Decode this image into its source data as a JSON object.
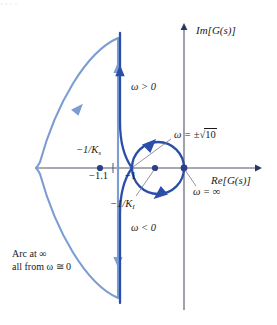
{
  "figure": {
    "kind": "nyquist-plot",
    "axes": {
      "imaginary_label": "Im[G(s)]",
      "real_label": "Re[G(s)]"
    },
    "colors": {
      "curve_dark": "#2b4fa8",
      "curve_light": "#7b9dd4",
      "axis": "#555566",
      "text": "#1a1a1a"
    },
    "labels": {
      "omega_positive": "ω > 0",
      "omega_negative": "ω < 0",
      "omega_sqrt10_pre": "ω = ±",
      "omega_sqrt10_radical": "√",
      "omega_sqrt10_value": "10",
      "omega_infinity": "ω = ∞",
      "minus_one_over_Ks_main": "−1/K",
      "minus_one_over_Ks_sub": "s",
      "minus_one_over_KI_main": "−1/K",
      "minus_one_over_KI_sub": "I",
      "point_minus_1_1": "−1.1",
      "point_minus_1": "−1",
      "caption_line1": "Arc at ∞",
      "caption_line2": "all from ω ≅ 0"
    },
    "marked_points": [
      {
        "name": "minus-1-1-point",
        "label": "−1.1",
        "x": -1.1
      },
      {
        "name": "minus-1-over-KI-point",
        "label": "−1/K I",
        "x": -0.5
      },
      {
        "name": "origin-point",
        "label": "ω = ∞",
        "x": 0
      }
    ]
  },
  "top_cut_text": "• • • •"
}
